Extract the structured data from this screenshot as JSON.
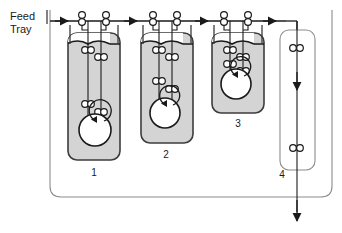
{
  "diagram": {
    "type": "process-flow-diagram",
    "feed_label_line1": "Feed",
    "feed_label_line2": "Tray",
    "colors": {
      "vessel_fill": "#d4d4d4",
      "vessel_stroke": "#3c3c3c",
      "line": "#1a1a1a",
      "loop_line": "#8c8c8c",
      "impeller_fill": "#ffffff",
      "fitting_fill": "#ffffff",
      "text": "#1a1a1a"
    },
    "vessels": [
      {
        "id": "vessel-1",
        "label": "1",
        "fill": "gray",
        "x": 68,
        "y": 33,
        "width": 52,
        "height": 127,
        "label_x": 94,
        "label_y": 176,
        "surface_y": 44,
        "impeller": {
          "cx": 95,
          "cy": 130,
          "r": 16
        },
        "downcomer_x": 88,
        "riser_x": 101,
        "fittings": [
          {
            "cx": 89,
            "cy": 50
          },
          {
            "cx": 98,
            "cy": 57
          },
          {
            "cx": 89,
            "cy": 104
          },
          {
            "cx": 98,
            "cy": 111
          }
        ]
      },
      {
        "id": "vessel-2",
        "label": "2",
        "fill": "gray",
        "x": 141,
        "y": 33,
        "width": 52,
        "height": 110,
        "label_x": 166,
        "label_y": 158,
        "surface_y": 44,
        "impeller": {
          "cx": 165,
          "cy": 113,
          "r": 15
        },
        "downcomer_x": 159,
        "riser_x": 172,
        "fittings": [
          {
            "cx": 160,
            "cy": 50
          },
          {
            "cx": 169,
            "cy": 57
          },
          {
            "cx": 160,
            "cy": 80
          },
          {
            "cx": 169,
            "cy": 88
          }
        ]
      },
      {
        "id": "vessel-3",
        "label": "3",
        "fill": "gray",
        "x": 212,
        "y": 33,
        "width": 52,
        "height": 80,
        "label_x": 238,
        "label_y": 127,
        "surface_y": 44,
        "impeller": {
          "cx": 236,
          "cy": 84,
          "r": 15
        },
        "downcomer_x": 230,
        "riser_x": 243,
        "fittings": [
          {
            "cx": 231,
            "cy": 50
          },
          {
            "cx": 240,
            "cy": 57
          },
          {
            "cx": 231,
            "cy": 63
          },
          {
            "cx": 240,
            "cy": 70
          }
        ]
      },
      {
        "id": "column-4",
        "label": "4",
        "fill": "white",
        "x": 280,
        "y": 30,
        "width": 35,
        "height": 140,
        "label_x": 282,
        "label_y": 178,
        "center_x": 297,
        "fittings": [
          {
            "cx": 293,
            "cy": 48
          },
          {
            "cx": 301,
            "cy": 48
          },
          {
            "cx": 293,
            "cy": 148
          },
          {
            "cx": 301,
            "cy": 148
          }
        ]
      }
    ],
    "top_fittings": [
      {
        "cx": 82,
        "cy": 17
      },
      {
        "cx": 106,
        "cy": 17
      },
      {
        "cx": 153,
        "cy": 17
      },
      {
        "cx": 177,
        "cy": 17
      },
      {
        "cx": 224,
        "cy": 17
      },
      {
        "cx": 248,
        "cy": 17
      }
    ],
    "flow_arrows": [
      {
        "name": "feed-inlet-arrow",
        "x": 63,
        "y": 21
      },
      {
        "name": "stage1-to-stage2-arrow",
        "x": 133,
        "y": 21
      },
      {
        "name": "stage2-to-stage3-arrow",
        "x": 204,
        "y": 21
      },
      {
        "name": "stage3-to-column-arrow",
        "x": 272,
        "y": 21
      },
      {
        "name": "column-down-arrow",
        "x": 297,
        "y": 85
      },
      {
        "name": "product-outlet-arrow",
        "x": 297,
        "y": 218
      }
    ],
    "recycle_loop": {
      "name": "recycle-loop",
      "left_x": 50,
      "right_x": 332,
      "top_y": 10,
      "bottom_y": 197
    }
  }
}
